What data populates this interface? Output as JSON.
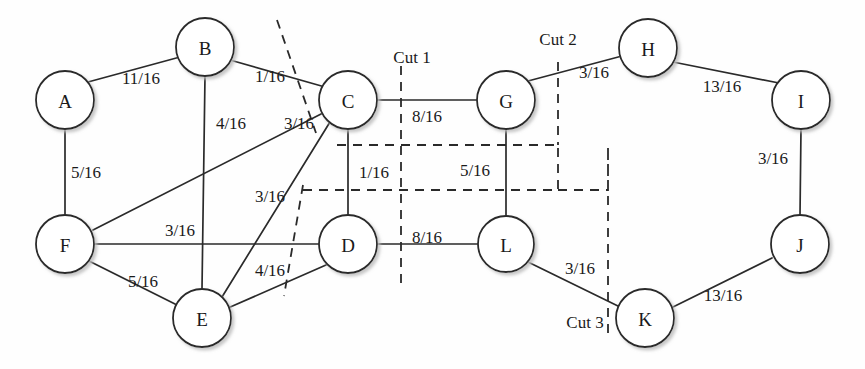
{
  "diagram": {
    "colors": {
      "node_stroke": "#2a2a2a",
      "node_fill": "#ffffff",
      "edge": "#2a2a2a",
      "cut": "#2a2a2a",
      "text": "#1a1a1a",
      "background": "#fefefe"
    },
    "node_radius": 29,
    "nodes": [
      {
        "id": "A",
        "label": "A",
        "x": 65,
        "y": 100,
        "r": 29
      },
      {
        "id": "B",
        "label": "B",
        "x": 205,
        "y": 47,
        "r": 29
      },
      {
        "id": "C",
        "label": "C",
        "x": 348,
        "y": 100,
        "r": 29
      },
      {
        "id": "D",
        "label": "D",
        "x": 348,
        "y": 244,
        "r": 29
      },
      {
        "id": "E",
        "label": "E",
        "x": 202,
        "y": 318,
        "r": 29
      },
      {
        "id": "F",
        "label": "F",
        "x": 65,
        "y": 244,
        "r": 29
      },
      {
        "id": "G",
        "label": "G",
        "x": 506,
        "y": 100,
        "r": 29
      },
      {
        "id": "H",
        "label": "H",
        "x": 648,
        "y": 48,
        "r": 29
      },
      {
        "id": "I",
        "label": "I",
        "x": 801,
        "y": 100,
        "r": 29
      },
      {
        "id": "J",
        "label": "J",
        "x": 800,
        "y": 244,
        "r": 29
      },
      {
        "id": "K",
        "label": "K",
        "x": 645,
        "y": 318,
        "r": 29
      },
      {
        "id": "L",
        "label": "L",
        "x": 506,
        "y": 244,
        "r": 28
      }
    ],
    "edges": [
      {
        "from": "A",
        "to": "B",
        "weight": "11/16",
        "lx": 141,
        "ly": 78
      },
      {
        "from": "B",
        "to": "C",
        "weight": "1/16",
        "lx": 270,
        "ly": 76
      },
      {
        "from": "B",
        "to": "E",
        "weight": "4/16",
        "lx": 231,
        "ly": 123
      },
      {
        "from": "A",
        "to": "F",
        "weight": "5/16",
        "lx": 86,
        "ly": 172
      },
      {
        "from": "C",
        "to": "F",
        "weight": "3/16",
        "lx": 299,
        "ly": 123
      },
      {
        "from": "C",
        "to": "E",
        "weight": "3/16",
        "lx": 270,
        "ly": 196
      },
      {
        "from": "C",
        "to": "D",
        "weight": "1/16",
        "lx": 374,
        "ly": 172
      },
      {
        "from": "C",
        "to": "G",
        "weight": "8/16",
        "lx": 427,
        "ly": 116
      },
      {
        "from": "F",
        "to": "D",
        "weight": "3/16",
        "lx": 180,
        "ly": 230
      },
      {
        "from": "F",
        "to": "E",
        "weight": "5/16",
        "lx": 143,
        "ly": 281
      },
      {
        "from": "D",
        "to": "E",
        "weight": "4/16",
        "lx": 270,
        "ly": 270
      },
      {
        "from": "D",
        "to": "L",
        "weight": "8/16",
        "lx": 427,
        "ly": 237
      },
      {
        "from": "G",
        "to": "L",
        "weight": "5/16",
        "lx": 475,
        "ly": 170
      },
      {
        "from": "G",
        "to": "H",
        "weight": "3/16",
        "lx": 594,
        "ly": 72
      },
      {
        "from": "H",
        "to": "I",
        "weight": "13/16",
        "lx": 722,
        "ly": 86
      },
      {
        "from": "I",
        "to": "J",
        "weight": "3/16",
        "lx": 773,
        "ly": 158
      },
      {
        "from": "J",
        "to": "K",
        "weight": "13/16",
        "lx": 723,
        "ly": 295
      },
      {
        "from": "K",
        "to": "L",
        "weight": "3/16",
        "lx": 580,
        "ly": 268
      }
    ],
    "cuts": [
      {
        "id": "cut1",
        "label": "Cut 1",
        "lx": 412,
        "ly": 57
      },
      {
        "id": "cut2",
        "label": "Cut 2",
        "lx": 558,
        "ly": 39
      },
      {
        "id": "cut3",
        "label": "Cut 3",
        "lx": 585,
        "ly": 322
      }
    ]
  }
}
